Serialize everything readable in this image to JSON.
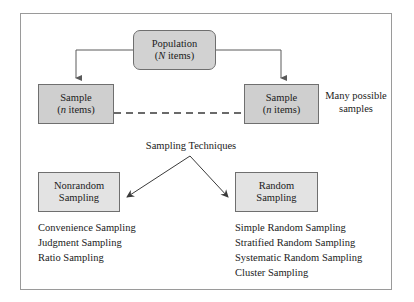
{
  "diagram": {
    "nodes": {
      "population": {
        "line1": "Population",
        "line2_italic": "N",
        "line2_rest": " items)",
        "line2_open": "(",
        "fill": "#d2d2d2"
      },
      "sample_left": {
        "line1": "Sample",
        "line2_italic": "n",
        "line2_open": "(",
        "line2_rest": " items)",
        "fill": "#cfcfcf"
      },
      "sample_right": {
        "line1": "Sample",
        "line2_italic": "n",
        "line2_open": "(",
        "line2_rest": " items)",
        "fill": "#cfcfcf"
      },
      "nonrandom": {
        "line1": "Nonrandom",
        "line2": "Sampling",
        "fill": "#e3e3e3"
      },
      "random": {
        "line1": "Random",
        "line2": "Sampling",
        "fill": "#e3e3e3"
      }
    },
    "labels": {
      "many_possible_samples_line1": "Many possible",
      "many_possible_samples_line2": "samples",
      "sampling_techniques": "Sampling Techniques"
    },
    "nonrandom_methods": [
      "Convenience Sampling",
      "Judgment Sampling",
      "Ratio Sampling"
    ],
    "random_methods": [
      "Simple Random Sampling",
      "Stratified Random Sampling",
      "Systematic Random Sampling",
      "Cluster Sampling"
    ],
    "colors": {
      "border": "#6f6f6f",
      "frame_border": "#9a9a9a",
      "connector": "#5a5a5a",
      "text": "#1b1b1b",
      "background": "#ffffff"
    }
  }
}
